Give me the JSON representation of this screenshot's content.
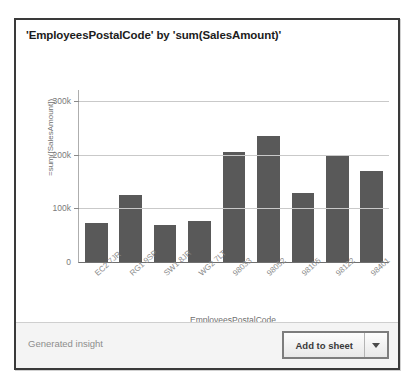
{
  "card": {
    "title": "'EmployeesPostalCode' by 'sum(SalesAmount)'"
  },
  "footer": {
    "label": "Generated insight",
    "add_button_label": "Add to sheet",
    "caret_icon": "chevron-down-icon"
  },
  "colors": {
    "bar": "#595959",
    "grid": "#c9c9c9",
    "axis": "#6f6f6f",
    "card_border": "#3a3a3a",
    "footer_bg": "#f4f4f4"
  },
  "chart_data": {
    "type": "bar",
    "title": "'EmployeesPostalCode' by 'sum(SalesAmount)'",
    "xlabel": "EmployeesPostalCode",
    "ylabel": "=sum([SalesAmount])",
    "categories": [
      "EC2 7JR",
      "RG1 9SP",
      "SW1 8JR",
      "WG2 7LT",
      "98033",
      "98052",
      "98105",
      "98122",
      "98401"
    ],
    "values": [
      72000,
      125000,
      68000,
      77000,
      205000,
      235000,
      128000,
      197000,
      170000
    ],
    "ylim": [
      0,
      320000
    ],
    "yticks": [
      0,
      100000,
      200000,
      300000
    ],
    "ytick_labels": [
      "0",
      "100k",
      "200k",
      "300k"
    ],
    "grid": true,
    "legend": false
  }
}
